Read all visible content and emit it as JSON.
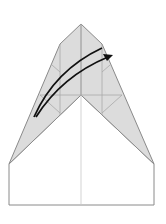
{
  "diagram": {
    "type": "origami-fold-step",
    "colors": {
      "background": "#ffffff",
      "paper_white": "#ffffff",
      "flap_gray": "#dcdcdc",
      "edge": "#8a8a8a",
      "crease": "#b0b0b0",
      "arrow": "#111111"
    },
    "arrows": [
      {
        "name": "fold-arrow-upper",
        "direction": "left-to-right"
      },
      {
        "name": "fold-arrow-lower",
        "direction": "left-to-right",
        "arrowhead": true
      }
    ]
  }
}
